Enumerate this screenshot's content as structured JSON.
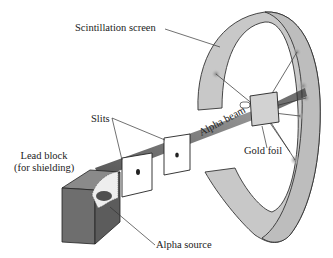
{
  "labels": {
    "scintillation_screen": "Scintillation screen",
    "slits": "Slits",
    "lead_block_line1": "Lead block",
    "lead_block_line2": "(for shielding)",
    "alpha_beam": "Alpha beam",
    "gold_foil": "Gold foil",
    "alpha_source": "Alpha source"
  },
  "colors": {
    "screen_fill": "#c8c8c8",
    "block_front": "#6e6e6e",
    "block_top": "#8a8a8a",
    "block_side": "#5c5c5c",
    "beam": "#333333",
    "foil_fill": "#d2d2d2",
    "line": "#333333"
  }
}
